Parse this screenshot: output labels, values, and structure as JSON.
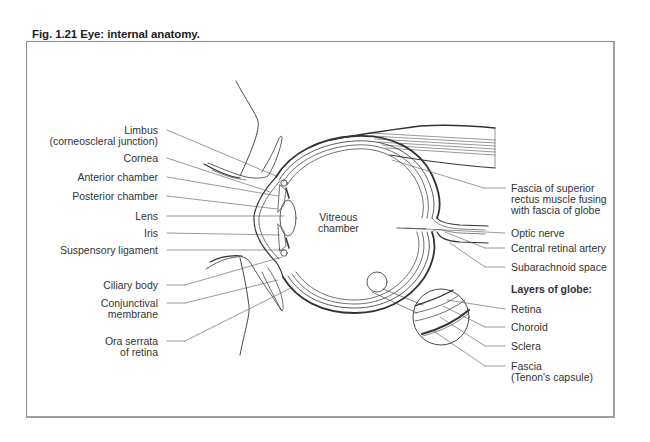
{
  "figure": {
    "title": "Fig. 1.21  Eye: internal anatomy."
  },
  "labels_left": [
    {
      "id": "limbus",
      "line1": "Limbus",
      "line2": "(corneoscleral junction)"
    },
    {
      "id": "cornea",
      "line1": "Cornea"
    },
    {
      "id": "anterior-chamber",
      "line1": "Anterior chamber"
    },
    {
      "id": "posterior-chamber",
      "line1": "Posterior chamber"
    },
    {
      "id": "lens",
      "line1": "Lens"
    },
    {
      "id": "iris",
      "line1": "Iris"
    },
    {
      "id": "suspensory-ligament",
      "line1": "Suspensory ligament"
    },
    {
      "id": "ciliary-body",
      "line1": "Ciliary body"
    },
    {
      "id": "conjunctival-membrane",
      "line1": "Conjunctival",
      "line2": "membrane"
    },
    {
      "id": "ora-serrata",
      "line1": "Ora serrata",
      "line2": "of retina"
    }
  ],
  "label_center": {
    "line1": "Vitreous",
    "line2": "chamber"
  },
  "labels_right": [
    {
      "id": "fascia-superior-rectus",
      "line1": "Fascia of superior",
      "line2": "rectus muscle fusing",
      "line3": "with fascia of globe"
    },
    {
      "id": "optic-nerve",
      "line1": "Optic nerve"
    },
    {
      "id": "central-retinal-artery",
      "line1": "Central retinal artery"
    },
    {
      "id": "subarachnoid-space",
      "line1": "Subarachnoid space"
    }
  ],
  "layers_of_globe": {
    "heading": "Layers of globe:",
    "items": [
      {
        "id": "retina",
        "line1": "Retina"
      },
      {
        "id": "choroid",
        "line1": "Choroid"
      },
      {
        "id": "sclera",
        "line1": "Sclera"
      },
      {
        "id": "fascia",
        "line1": "Fascia",
        "line2": "(Tenon's capsule)"
      }
    ]
  }
}
